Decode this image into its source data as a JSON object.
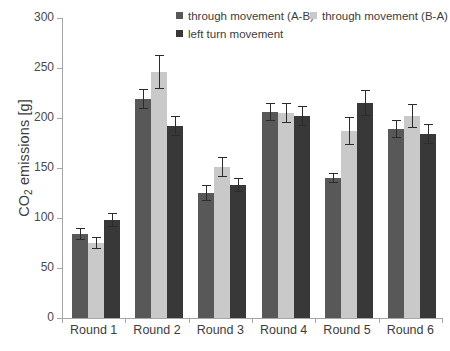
{
  "chart_data": {
    "type": "bar",
    "title": "",
    "xlabel": "",
    "ylabel": "CO2 emissions [g]",
    "ylabel_prefix": "CO",
    "ylabel_sub": "2",
    "ylabel_suffix": " emissions [g]",
    "ylim": [
      0,
      300
    ],
    "yticks": [
      0,
      50,
      100,
      150,
      200,
      250,
      300
    ],
    "ytick_labels": [
      "0",
      "50",
      "100",
      "150",
      "200",
      "250",
      "300"
    ],
    "grid": false,
    "legend_position": "top-center",
    "categories": [
      "Round 1",
      "Round 2",
      "Round 3",
      "Round 4",
      "Round 5",
      "Round 6"
    ],
    "series": [
      {
        "name": "through movement (A-B)",
        "color": "#585858",
        "values": [
          84,
          219,
          125,
          206,
          140,
          189
        ],
        "errors": [
          6,
          10,
          8,
          9,
          5,
          9
        ]
      },
      {
        "name": "through movement (B-A)",
        "color": "#c9c9c9",
        "values": [
          75,
          246,
          151,
          205,
          187,
          202
        ],
        "errors": [
          6,
          17,
          10,
          10,
          14,
          12
        ]
      },
      {
        "name": "left turn movement",
        "color": "#383838",
        "values": [
          98,
          192,
          133,
          202,
          215,
          184
        ],
        "errors": [
          7,
          10,
          7,
          10,
          13,
          10
        ]
      }
    ]
  },
  "legend": {
    "items": [
      {
        "label": "through movement (A-B)",
        "swatch": "swatch-dark-gray"
      },
      {
        "label": "through movement (B-A)",
        "swatch": "swatch-light-gray"
      },
      {
        "label": "left turn movement",
        "swatch": "swatch-darkest-gray"
      }
    ]
  }
}
